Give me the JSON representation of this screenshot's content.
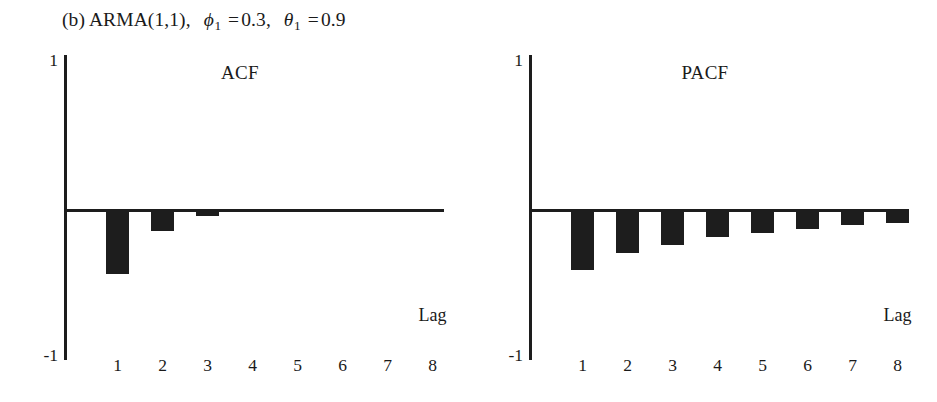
{
  "caption": {
    "prefix": "(b) ARMA(1,1),",
    "phi_symbol": "ϕ",
    "phi_sub": "1",
    "phi_eq": "=",
    "phi_value": "0.3",
    "comma": ",",
    "theta_symbol": "θ",
    "theta_sub": "1",
    "theta_eq": "=",
    "theta_value": "0.9",
    "full_text": "(b) ARMA(1,1), ϕ₁ = 0.3, θ₁ = 0.9"
  },
  "axis": {
    "y_top_label": "1",
    "y_bottom_label": "-1",
    "x_axis_title": "Lag",
    "ylim": [
      -1,
      1
    ],
    "tick_labels": [
      "1",
      "2",
      "3",
      "4",
      "5",
      "6",
      "7",
      "8"
    ]
  },
  "colors": {
    "bar": "#1d1d1d",
    "axis": "#1d1d1d",
    "background": "#ffffff",
    "text": "#1a1a1a"
  },
  "chart_data": [
    {
      "type": "bar",
      "title": "ACF",
      "xlabel": "Lag",
      "ylabel": "",
      "categories": [
        "1",
        "2",
        "3",
        "4",
        "5",
        "6",
        "7",
        "8"
      ],
      "values": [
        -0.42,
        -0.135,
        -0.035,
        -0.008,
        -0.003,
        -0.001,
        0,
        0
      ],
      "ylim": [
        -1,
        1
      ],
      "grid": false,
      "legend": false,
      "annotations": [
        "ARMA(1,1) with phi_1 = 0.3, theta_1 = 0.9; ACF damps out quickly after lag 1"
      ]
    },
    {
      "type": "bar",
      "title": "PACF",
      "xlabel": "Lag",
      "ylabel": "",
      "categories": [
        "1",
        "2",
        "3",
        "4",
        "5",
        "6",
        "7",
        "8"
      ],
      "values": [
        -0.39,
        -0.28,
        -0.225,
        -0.175,
        -0.145,
        -0.12,
        -0.095,
        -0.08
      ],
      "ylim": [
        -1,
        1
      ],
      "grid": false,
      "legend": false,
      "annotations": [
        "PACF decays geometrically, all values negative"
      ]
    }
  ]
}
